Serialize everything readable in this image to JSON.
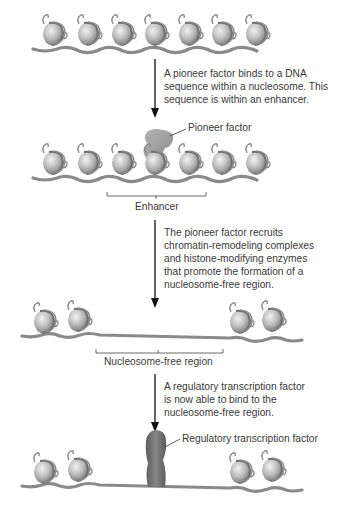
{
  "diagram": {
    "type": "process-flow",
    "stages": [
      {
        "id": "stage-1",
        "description": "Chromatin with nucleosomes",
        "nucleosome_count": 7
      },
      {
        "id": "stage-2",
        "description": "Pioneer factor bound to nucleosome within enhancer",
        "nucleosome_count": 7,
        "labels": {
          "protein": "Pioneer factor",
          "bracket": "Enhancer"
        }
      },
      {
        "id": "stage-3",
        "description": "Nucleosome-free region formed",
        "nucleosome_count": 4,
        "labels": {
          "bracket": "Nucleosome-free region"
        }
      },
      {
        "id": "stage-4",
        "description": "Regulatory transcription factor bound",
        "nucleosome_count": 4,
        "labels": {
          "protein": "Regulatory transcription factor"
        }
      }
    ],
    "steps": [
      {
        "text": "A pioneer factor binds to a DNA sequence within a nucleosome. This sequence is within an enhancer."
      },
      {
        "text": "The pioneer factor recruits chromatin-remodeling complexes and histone-modifying enzymes that promote the formation of a nucleosome-free region."
      },
      {
        "text": "A regulatory transcription factor is now able to bind to the nucleosome-free region."
      }
    ],
    "colors": {
      "nucleosome": "#b8b8b8",
      "dna": "#8a8a8a",
      "pioneer_factor": "#a0a0a0",
      "regulatory_factor": "#707070",
      "arrow": "#111111",
      "text": "#3a3a3a"
    }
  }
}
